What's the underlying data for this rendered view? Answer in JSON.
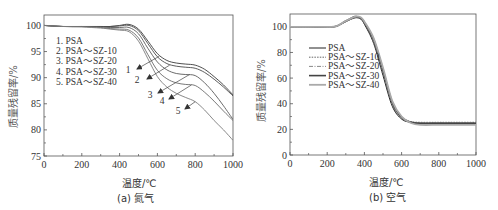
{
  "chart_data": [
    {
      "type": "line",
      "panel": "a",
      "caption": "(a) 氮气",
      "title": "",
      "xlabel": "温度/℃",
      "ylabel": "质量残留率/%",
      "xlim": [
        0,
        1000
      ],
      "ylim": [
        75,
        102
      ],
      "xticks": [
        0,
        200,
        400,
        600,
        800,
        1000
      ],
      "yticks": [
        75,
        80,
        85,
        90,
        95,
        100
      ],
      "grid": false,
      "legend_position": "upper-left",
      "legend": [
        "1. PSA",
        "2. PSA～SZ-10",
        "3. PSA～SZ-20",
        "4. PSA～SZ-30",
        "5. PSA～SZ-40"
      ],
      "annotations": [
        "1",
        "2",
        "3",
        "4",
        "5"
      ],
      "x": [
        0,
        100,
        200,
        300,
        350,
        400,
        450,
        500,
        550,
        600,
        650,
        700,
        750,
        800,
        850,
        900,
        950,
        1000
      ],
      "series": [
        {
          "name": "PSA",
          "values": [
            100,
            99.8,
            99.8,
            99.8,
            99.8,
            100,
            100.2,
            99.3,
            97.0,
            94.6,
            93.3,
            92.8,
            92.6,
            92.4,
            91.6,
            90.2,
            88.6,
            86.7
          ]
        },
        {
          "name": "PSA～SZ-10",
          "values": [
            100,
            99.8,
            99.8,
            99.8,
            99.8,
            99.9,
            100.0,
            99.0,
            96.5,
            94.0,
            92.7,
            92.2,
            92.0,
            91.8,
            91.0,
            89.7,
            88.2,
            86.5
          ]
        },
        {
          "name": "PSA～SZ-20",
          "values": [
            100,
            99.8,
            99.8,
            99.7,
            99.6,
            99.6,
            99.6,
            98.4,
            95.6,
            93.0,
            91.5,
            90.8,
            90.6,
            90.4,
            89.0,
            87.0,
            84.6,
            82.0
          ]
        },
        {
          "name": "PSA～SZ-30",
          "values": [
            100,
            99.8,
            99.8,
            99.6,
            99.4,
            99.3,
            99.1,
            97.6,
            94.4,
            91.4,
            89.8,
            89.0,
            88.7,
            88.5,
            87.2,
            85.5,
            83.6,
            81.8
          ]
        },
        {
          "name": "PSA～SZ-40",
          "values": [
            100,
            99.8,
            99.7,
            99.5,
            99.3,
            99.1,
            98.8,
            97.0,
            93.6,
            90.2,
            88.2,
            87.0,
            86.2,
            85.4,
            83.8,
            81.8,
            80.0,
            78.0
          ]
        }
      ]
    },
    {
      "type": "line",
      "panel": "b",
      "caption": "(b) 空气",
      "title": "",
      "xlabel": "温度/℃",
      "ylabel": "质量残留率/%",
      "xlim": [
        0,
        1000
      ],
      "ylim": [
        0,
        110
      ],
      "xticks": [
        0,
        200,
        400,
        600,
        800,
        1000
      ],
      "yticks": [
        0,
        20,
        40,
        60,
        80,
        100
      ],
      "grid": false,
      "legend_position": "center-left",
      "legend": [
        "PSA",
        "PSA～SZ-10",
        "PSA～SZ-20",
        "PSA～SZ-30",
        "PSA～SZ-40"
      ],
      "x": [
        0,
        100,
        200,
        250,
        300,
        350,
        380,
        400,
        450,
        500,
        550,
        600,
        650,
        700,
        800,
        900,
        1000
      ],
      "series": [
        {
          "name": "PSA",
          "values": [
            100,
            100,
            100,
            100.5,
            104,
            107,
            106,
            102,
            87,
            62,
            38,
            28,
            25.5,
            25,
            25,
            25,
            25
          ]
        },
        {
          "name": "PSA～SZ-10",
          "values": [
            100,
            100,
            100,
            100.5,
            104,
            107.5,
            106.5,
            102.5,
            88,
            63.5,
            39,
            28.5,
            26,
            25.5,
            25.5,
            25.5,
            25.5
          ]
        },
        {
          "name": "PSA～SZ-20",
          "values": [
            100,
            100,
            100,
            100.5,
            104,
            107.5,
            106.5,
            103,
            89,
            65,
            40,
            29,
            26,
            25,
            25,
            25,
            25
          ]
        },
        {
          "name": "PSA～SZ-30",
          "values": [
            100,
            100,
            100,
            100.5,
            104.5,
            108,
            107,
            103.5,
            90,
            66.5,
            41,
            29.5,
            25.5,
            24.5,
            24.5,
            24.5,
            24.5
          ]
        },
        {
          "name": "PSA～SZ-40",
          "values": [
            100,
            100,
            100,
            100.5,
            104.5,
            108,
            107.5,
            104,
            91,
            68,
            42,
            30,
            25,
            23.5,
            23.5,
            23.5,
            23.5
          ]
        }
      ]
    }
  ],
  "panels": {
    "a": {
      "caption": "(a) 氮气",
      "xlabel": "温度/℃",
      "ylabel": "质量残留率/%"
    },
    "b": {
      "caption": "(b) 空气",
      "xlabel": "温度/℃",
      "ylabel": "质量残留率/%"
    }
  },
  "colors": {
    "axis": "#555555",
    "series_a": [
      "#3a3a3a",
      "#4a4a4a",
      "#5a5a5a",
      "#6a6a6a",
      "#7a7a7a"
    ],
    "series_b": [
      "#222222",
      "#555555",
      "#888888",
      "#444444",
      "#aaaaaa"
    ]
  }
}
